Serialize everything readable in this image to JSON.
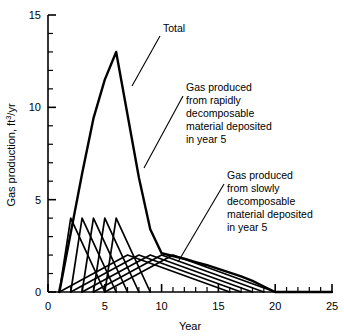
{
  "chart_data": {
    "type": "line",
    "title": "",
    "xlabel": "Year",
    "ylabel": "Gas production, ft3/yr",
    "ylabel_parts": {
      "pre": "Gas production, ft",
      "sup": "3",
      "post": "/yr"
    },
    "xlim": [
      0,
      25
    ],
    "ylim": [
      0,
      15
    ],
    "xticks": [
      0,
      5,
      10,
      15,
      20,
      25
    ],
    "yticks": [
      0,
      5,
      10,
      15
    ],
    "xticklabels": [
      "0",
      "5",
      "10",
      "15",
      "20",
      "25"
    ],
    "yticklabels": [
      "0",
      "5",
      "10",
      "15"
    ],
    "x_minor_step": 1,
    "y_minor_step": 1,
    "grid": false,
    "legend": "none",
    "series": [
      {
        "name": "Total",
        "kind": "total-envelope",
        "x": [
          1,
          2,
          3,
          4,
          5,
          6,
          7,
          8,
          9,
          10,
          11,
          12,
          13,
          14,
          15,
          16,
          17,
          18,
          19,
          20,
          25
        ],
        "y": [
          0,
          3.2,
          6.4,
          9.4,
          11.5,
          13.0,
          9.6,
          6.2,
          3.4,
          2.1,
          1.95,
          1.8,
          1.62,
          1.45,
          1.25,
          1.05,
          0.85,
          0.6,
          0.3,
          0.0,
          0.0
        ]
      },
      {
        "name": "Gas produced from rapidly decomposable material",
        "kind": "rapid-triangles",
        "peak_value": 4.0,
        "triangles": [
          {
            "deposit_year": 1,
            "start": 1,
            "peak": 2,
            "end": 5
          },
          {
            "deposit_year": 2,
            "start": 2,
            "peak": 3,
            "end": 6
          },
          {
            "deposit_year": 3,
            "start": 3,
            "peak": 4,
            "end": 7
          },
          {
            "deposit_year": 4,
            "start": 4,
            "peak": 5,
            "end": 8
          },
          {
            "deposit_year": 5,
            "start": 5,
            "peak": 6,
            "end": 9
          }
        ]
      },
      {
        "name": "Gas produced from slowly decomposable material",
        "kind": "slow-triangles",
        "peak_value": 2.0,
        "triangles": [
          {
            "deposit_year": 1,
            "start": 1,
            "peak": 7,
            "end": 16
          },
          {
            "deposit_year": 2,
            "start": 2,
            "peak": 8,
            "end": 17
          },
          {
            "deposit_year": 3,
            "start": 3,
            "peak": 9,
            "end": 18
          },
          {
            "deposit_year": 4,
            "start": 4,
            "peak": 10,
            "end": 19
          },
          {
            "deposit_year": 5,
            "start": 5,
            "peak": 11,
            "end": 20
          }
        ]
      }
    ],
    "annotations": [
      {
        "id": "total",
        "lines": [
          "Total"
        ],
        "text_x": 163,
        "text_y": 32,
        "leader": {
          "x1": 160,
          "y1": 36,
          "x2": 132,
          "y2": 86
        }
      },
      {
        "id": "rapid",
        "lines": [
          "Gas produced",
          "from rapidly",
          "decomposable",
          "material deposited",
          "in year 5"
        ],
        "text_x": 186,
        "text_y": 91,
        "leader": {
          "x1": 183,
          "y1": 96,
          "x2": 144,
          "y2": 168
        }
      },
      {
        "id": "slow",
        "lines": [
          "Gas produced",
          "from slowly",
          "decomposable",
          "material deposited",
          "in year 5"
        ],
        "text_x": 227,
        "text_y": 179,
        "leader": {
          "x1": 224,
          "y1": 184,
          "x2": 178,
          "y2": 262
        }
      }
    ]
  }
}
